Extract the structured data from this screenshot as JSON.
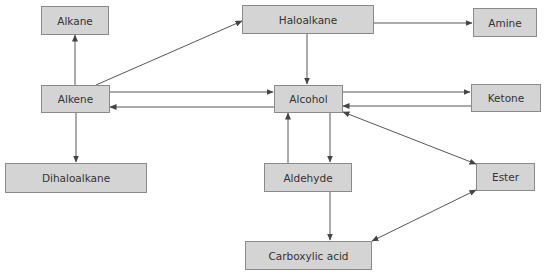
{
  "diagram": {
    "type": "reaction-pathway-flowchart",
    "colors": {
      "box_fill": "#d4d4d4",
      "box_border": "#8a8a8a",
      "arrow": "#444444",
      "text": "#333333"
    },
    "nodes": {
      "alkane": "Alkane",
      "haloalkane": "Haloalkane",
      "amine": "Amine",
      "alkene": "Alkene",
      "alcohol": "Alcohol",
      "ketone": "Ketone",
      "dihaloalkane": "Dihaloalkane",
      "aldehyde": "Aldehyde",
      "ester": "Ester",
      "carboxylic_acid": "Carboxylic acid"
    },
    "edges": [
      {
        "from": "Alkene",
        "to": "Alkane"
      },
      {
        "from": "Alkene",
        "to": "Haloalkane"
      },
      {
        "from": "Alkene",
        "to": "Alcohol"
      },
      {
        "from": "Alcohol",
        "to": "Alkene"
      },
      {
        "from": "Alkene",
        "to": "Dihaloalkane"
      },
      {
        "from": "Haloalkane",
        "to": "Amine"
      },
      {
        "from": "Haloalkane",
        "to": "Alcohol"
      },
      {
        "from": "Alcohol",
        "to": "Ketone"
      },
      {
        "from": "Ketone",
        "to": "Alcohol"
      },
      {
        "from": "Alcohol",
        "to": "Aldehyde"
      },
      {
        "from": "Aldehyde",
        "to": "Alcohol"
      },
      {
        "from": "Alcohol",
        "to": "Ester",
        "bidirectional": true
      },
      {
        "from": "Aldehyde",
        "to": "Carboxylic acid"
      },
      {
        "from": "Carboxylic acid",
        "to": "Ester",
        "bidirectional": true
      }
    ]
  }
}
